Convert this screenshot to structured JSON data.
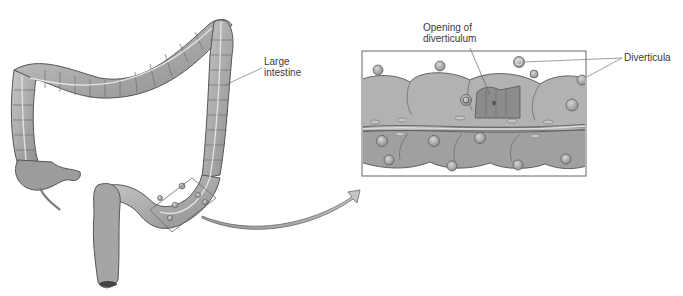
{
  "diagram": {
    "labels": {
      "large_intestine": [
        "Large",
        "intestine"
      ],
      "opening": [
        "Opening of",
        "diverticulum"
      ],
      "diverticula": "Diverticula"
    },
    "inset": {
      "description": "Magnified section of sigmoid colon showing diverticula"
    },
    "colors": {
      "tissue": "#a9a9a9",
      "tissue_light": "#c4c4c4",
      "tissue_dark": "#7d7d7d",
      "outline": "#555555",
      "leader_line": "#777777",
      "frame": "#666666"
    }
  }
}
